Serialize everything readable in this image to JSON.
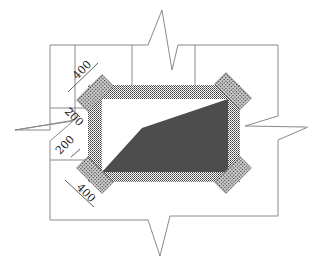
{
  "diagram": {
    "type": "structural-detail",
    "colors": {
      "line": "#777777",
      "hatch_dark": "#444444",
      "fill_dark": "#4a4a4a",
      "background": "#ffffff"
    },
    "dimensions": {
      "top_left_length": "400",
      "top_left_offset": "200",
      "bottom_left_offset": "200",
      "bottom_left_length": "400"
    }
  }
}
